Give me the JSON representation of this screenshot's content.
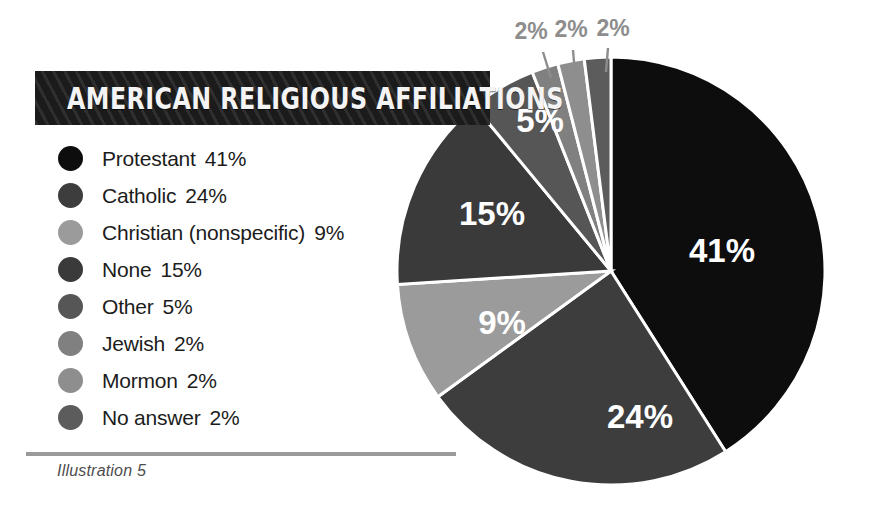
{
  "title": {
    "text": "AMERICAN RELIGIOUS AFFILIATIONS"
  },
  "caption": {
    "text": "Illustration 5"
  },
  "legend": {
    "items": [
      {
        "label": "Protestant",
        "percent": "41%",
        "color": "#0d0d0d"
      },
      {
        "label": "Catholic",
        "percent": "24%",
        "color": "#3d3d3d"
      },
      {
        "label": "Christian (nonspecific)",
        "percent": "9%",
        "color": "#9b9b9b"
      },
      {
        "label": "None",
        "percent": "15%",
        "color": "#3a3a3a"
      },
      {
        "label": "Other",
        "percent": "5%",
        "color": "#565656"
      },
      {
        "label": "Jewish",
        "percent": "2%",
        "color": "#808080"
      },
      {
        "label": "Mormon",
        "percent": "2%",
        "color": "#8e8e8e"
      },
      {
        "label": "No answer",
        "percent": "2%",
        "color": "#5c5c5c"
      }
    ]
  },
  "chart_data": {
    "type": "pie",
    "title": "AMERICAN RELIGIOUS AFFILIATIONS",
    "xlabel": "",
    "ylabel": "",
    "units": "percent",
    "total": 100,
    "start_angle_deg": 0,
    "direction": "clockwise",
    "legend_position": "left",
    "grid": false,
    "categories": [
      "Protestant",
      "Catholic",
      "Christian (nonspecific)",
      "None",
      "Other",
      "Jewish",
      "Mormon",
      "No answer"
    ],
    "values": [
      41,
      24,
      9,
      15,
      5,
      2,
      2,
      2
    ],
    "colors": [
      "#0d0d0d",
      "#3d3d3d",
      "#9b9b9b",
      "#3a3a3a",
      "#565656",
      "#808080",
      "#8e8e8e",
      "#5c5c5c"
    ],
    "slice_labels": [
      "41%",
      "24%",
      "9%",
      "15%",
      "5%",
      "2%",
      "2%",
      "2%"
    ],
    "labels_inside": [
      true,
      true,
      true,
      true,
      true,
      false,
      false,
      false
    ],
    "callout_labels": [
      "2%",
      "2%",
      "2%"
    ],
    "annotations": []
  },
  "pie_geometry": {
    "cx": 611,
    "cy": 271,
    "r": 214,
    "stroke": "#ffffff",
    "stroke_width": 3
  },
  "callouts": [
    {
      "text": "2%",
      "label_x": 531,
      "label_y": 33,
      "line_x1": 543,
      "line_y1": 52,
      "line_x2": 551,
      "line_y2": 78
    },
    {
      "text": "2%",
      "label_x": 571,
      "label_y": 31,
      "line_x1": 573,
      "line_y1": 50,
      "line_x2": 575,
      "line_y2": 74
    },
    {
      "text": "2%",
      "label_x": 613,
      "label_y": 30,
      "line_x1": 608,
      "line_y1": 48,
      "line_x2": 606,
      "line_y2": 72
    }
  ],
  "slice_label_positions": [
    {
      "text": "41%",
      "x": 722,
      "y": 253
    },
    {
      "text": "24%",
      "x": 640,
      "y": 419
    },
    {
      "text": "9%",
      "x": 502,
      "y": 325
    },
    {
      "text": "15%",
      "x": 492,
      "y": 216
    },
    {
      "text": "5%",
      "x": 540,
      "y": 123
    }
  ]
}
